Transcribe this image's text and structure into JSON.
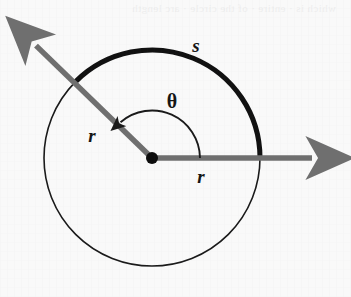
{
  "figure": {
    "name": "radian-measure-circle-diagram",
    "background_color": "#f9f9f9"
  },
  "labels": {
    "arc_length": "s",
    "radius_diagonal": "r",
    "radius_horizontal": "r",
    "central_angle": "θ"
  },
  "colors": {
    "circle_stroke": "#1a1a1a",
    "arc_highlight": "#111111",
    "ray_gray": "#6f6f6f",
    "center_dot": "#0d0d0d",
    "angle_arc": "#1a1a1a",
    "label_text": "#151515"
  },
  "geometry": {
    "center_x": 152,
    "center_y": 158,
    "radius": 108,
    "arc_start_angle_deg": 0,
    "arc_end_angle_deg": 135,
    "angle_theta_deg": 135,
    "circle_stroke_width": 1.6,
    "arc_stroke_width": 5,
    "ray_stroke_width": 5.5,
    "center_dot_radius": 6
  },
  "rays": {
    "horizontal": {
      "name": "initial-side-ray",
      "from_x": 152,
      "from_y": 158,
      "to_x": 322,
      "to_y": 158,
      "direction_deg": 0
    },
    "diagonal": {
      "name": "terminal-side-ray",
      "from_x": 152,
      "from_y": 158,
      "to_x": 26,
      "to_y": 36,
      "direction_deg": 135
    }
  },
  "label_positions": {
    "s": {
      "x": 196,
      "y": 52
    },
    "r_diagonal": {
      "x": 92,
      "y": 142
    },
    "r_horizontal": {
      "x": 201,
      "y": 183
    },
    "theta": {
      "x": 172,
      "y": 108
    }
  },
  "bleed_text": "which is · entire · of the circle · arc length"
}
